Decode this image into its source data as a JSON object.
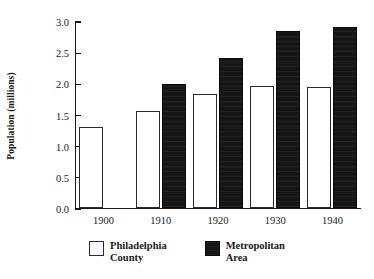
{
  "chart_data": {
    "type": "bar",
    "title": "",
    "xlabel": "",
    "ylabel": "Population (millions)",
    "categories": [
      "1900",
      "1910",
      "1920",
      "1930",
      "1940"
    ],
    "series": [
      {
        "name": "Philadelphia County",
        "color": "#ffffff",
        "values": [
          1.29,
          1.55,
          1.82,
          1.95,
          1.93
        ]
      },
      {
        "name": "Metropolitan Area",
        "color": "#151515",
        "values": [
          null,
          1.99,
          2.4,
          2.84,
          2.89
        ]
      }
    ],
    "ylim": [
      0.0,
      3.0
    ],
    "yticks": [
      "0.0",
      "0.5",
      "1.0",
      "1.5",
      "2.0",
      "2.5",
      "3.0"
    ],
    "ytick_values": [
      0.0,
      0.5,
      1.0,
      1.5,
      2.0,
      2.5,
      3.0
    ],
    "grid": false,
    "legend_position": "bottom",
    "legend": [
      {
        "label": "Philadelphia\nCounty",
        "swatch": "open"
      },
      {
        "label": "Metropolitan\nArea",
        "swatch": "filled"
      }
    ]
  }
}
